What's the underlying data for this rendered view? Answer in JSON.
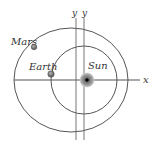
{
  "diagram": {
    "type": "orbital-diagram",
    "labels": {
      "mars": "Mars",
      "earth": "Earth",
      "sun": "Sun",
      "x_axis": "x",
      "y_axis_1": "y",
      "y_axis_2": "y"
    },
    "colors": {
      "line": "#555555",
      "planet": "#777777",
      "sun_glow": "#9a9a9a",
      "sun_core": "#000000",
      "text": "#333333"
    },
    "bodies": [
      {
        "name": "Mars",
        "orbit": "outer"
      },
      {
        "name": "Earth",
        "orbit": "inner"
      },
      {
        "name": "Sun",
        "orbit": "center"
      }
    ]
  }
}
